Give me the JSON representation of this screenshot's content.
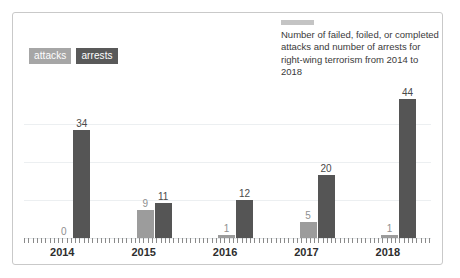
{
  "figure": {
    "border_color": "#c9c9c9",
    "background": "#ffffff"
  },
  "legend": {
    "position": "top-left",
    "items": [
      {
        "label": "attacks",
        "color": "#9c9c9c"
      },
      {
        "label": "arrests",
        "color": "#555555"
      }
    ]
  },
  "title_block": {
    "swatch_color": "#c4c4c4",
    "text": "Number of failed, foiled, or completed attacks and number of arrests for right-wing terrorism from 2014 to 2018"
  },
  "chart_data": {
    "type": "bar",
    "title": "Number of failed, foiled, or completed attacks and number of arrests for right-wing terrorism from 2014 to 2018",
    "xlabel": "",
    "ylabel": "",
    "categories": [
      "2014",
      "2015",
      "2016",
      "2017",
      "2018"
    ],
    "series": [
      {
        "name": "attacks",
        "color": "#9c9c9c",
        "values": [
          0,
          9,
          1,
          5,
          1
        ]
      },
      {
        "name": "arrests",
        "color": "#555555",
        "values": [
          34,
          11,
          12,
          20,
          44
        ]
      }
    ],
    "ylim": [
      0,
      48
    ],
    "grid": true,
    "gridlines": [
      12,
      24,
      36
    ],
    "legend_position": "top-left",
    "data_labels": true
  },
  "axis": {
    "tick_count": 96,
    "tick_color": "#8a8a8a"
  }
}
